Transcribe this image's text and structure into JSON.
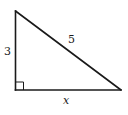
{
  "figure": {
    "type": "right-triangle",
    "vertices": {
      "top": {
        "x": 15.5,
        "y": 11
      },
      "right_angle": {
        "x": 15.5,
        "y": 90
      },
      "bottom_right": {
        "x": 121,
        "y": 90
      }
    },
    "stroke_color": "#1a1a1a",
    "right_angle_marker_size": 8,
    "labels": {
      "vertical_leg": "3",
      "hypotenuse": "5",
      "horizontal_leg": "x"
    }
  }
}
